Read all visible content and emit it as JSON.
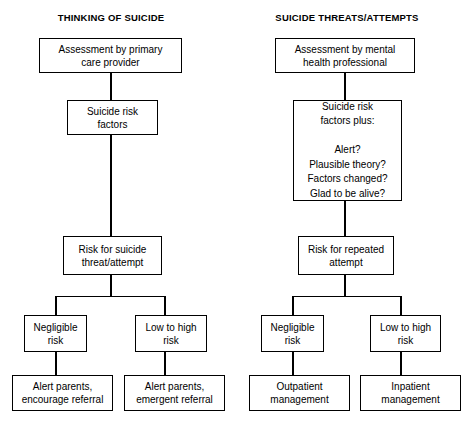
{
  "diagram": {
    "title_left": "THINKING OF SUICIDE",
    "title_right": "SUICIDE THREATS/ATTEMPTS",
    "background_color": "#ffffff",
    "line_color": "#000000",
    "text_color": "#000000",
    "columns": [
      {
        "id": "thinking-of-suicide",
        "heading": "THINKING OF SUICIDE",
        "nodes": {
          "assessment": "Assessment by primary\ncare provider",
          "risk_factors": "Suicide risk\nfactors",
          "risk_level": "Risk for suicide\nthreat/attempt",
          "branch_left": "Negligible\nrisk",
          "branch_right": "Low to high\nrisk",
          "outcome_left": "Alert parents,\nencourage referral",
          "outcome_right": "Alert parents,\nemergent referral"
        }
      },
      {
        "id": "suicide-threats-attempts",
        "heading": "SUICIDE THREATS/ATTEMPTS",
        "nodes": {
          "assessment": "Assessment by mental\nhealth professional",
          "risk_factors": "Suicide risk\nfactors plus:\n\nAlert?\nPlausible theory?\nFactors changed?\nGlad to be alive?",
          "risk_level": "Risk for repeated\nattempt",
          "branch_left": "Negligible\nrisk",
          "branch_right": "Low to high\nrisk",
          "outcome_left": "Outpatient\nmanagement",
          "outcome_right": "Inpatient\nmanagement"
        }
      }
    ]
  }
}
